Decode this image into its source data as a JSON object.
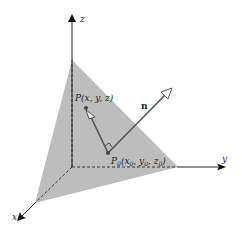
{
  "diagram": {
    "axes": {
      "x": {
        "label": "x"
      },
      "y": {
        "label": "y"
      },
      "z": {
        "label": "z"
      }
    },
    "points": {
      "P": {
        "label": "P(x, y, z)"
      },
      "P0": {
        "label_main": "P",
        "label_sub": "0",
        "label_rest": "(x",
        "x_sub": "0",
        "y_part": ", y",
        "y_sub": "0",
        "z_part": ", z",
        "z_sub": "0",
        "close": ")"
      }
    },
    "vectors": {
      "n": {
        "label": "n"
      }
    },
    "colors": {
      "plane_fill": "#bdbdbd",
      "axis": "#222222",
      "vector": "#555555",
      "point": "#444444"
    }
  }
}
